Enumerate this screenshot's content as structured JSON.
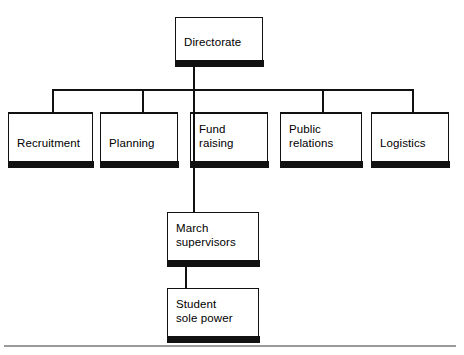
{
  "diagram": {
    "type": "organizational-chart",
    "background_color": "#ffffff",
    "line_color": "#111111",
    "box_fill_color": "#ffffff",
    "box_shadow_bar_color": "#111111",
    "footer_rule_color": "#9a9a9a",
    "levels": 4
  },
  "nodes": {
    "directorate": {
      "label": "Directorate",
      "level": 1,
      "x": 175,
      "y": 17,
      "w": 88,
      "h": 43
    },
    "recruitment": {
      "label": "Recruitment",
      "level": 2,
      "x": 8,
      "y": 113,
      "w": 85,
      "h": 48
    },
    "planning": {
      "label": "Planning",
      "level": 2,
      "x": 100,
      "y": 113,
      "w": 78,
      "h": 48
    },
    "fund_raising": {
      "label": "Fund\nraising",
      "level": 2,
      "x": 190,
      "y": 113,
      "w": 78,
      "h": 48
    },
    "public_relations": {
      "label": "Public\nrelations",
      "level": 2,
      "x": 280,
      "y": 113,
      "w": 82,
      "h": 48
    },
    "logistics": {
      "label": "Logistics",
      "level": 2,
      "x": 371,
      "y": 113,
      "w": 78,
      "h": 48
    },
    "march_supervisors": {
      "label": "March\nsupervisors",
      "level": 3,
      "x": 167,
      "y": 212,
      "w": 92,
      "h": 48
    },
    "student_sole_power": {
      "label": "Student\nsole power",
      "level": 4,
      "x": 167,
      "y": 288,
      "w": 92,
      "h": 48
    }
  },
  "edges": [
    {
      "from": "directorate",
      "to": "recruitment"
    },
    {
      "from": "directorate",
      "to": "planning"
    },
    {
      "from": "directorate",
      "to": "fund_raising"
    },
    {
      "from": "directorate",
      "to": "public_relations"
    },
    {
      "from": "directorate",
      "to": "logistics"
    },
    {
      "from": "directorate",
      "to": "march_supervisors"
    },
    {
      "from": "march_supervisors",
      "to": "student_sole_power"
    }
  ],
  "footer": {
    "caption": ""
  }
}
